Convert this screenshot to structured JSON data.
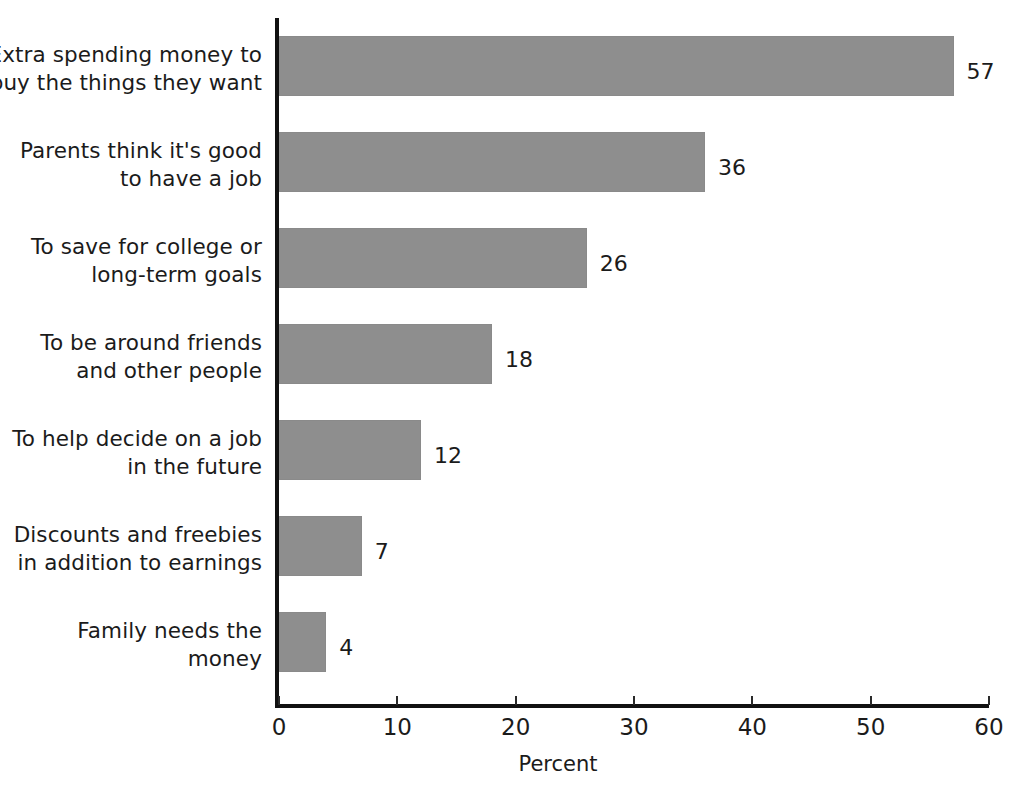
{
  "chart_data": {
    "type": "bar",
    "orientation": "horizontal",
    "title": "",
    "xlabel": "Percent",
    "ylabel": "",
    "xlim": [
      0,
      60
    ],
    "xticks": [
      0,
      10,
      20,
      30,
      40,
      50,
      60
    ],
    "xtick_labels": [
      "0",
      "10",
      "20",
      "30",
      "40",
      "50",
      "60"
    ],
    "grid": false,
    "legend": null,
    "bar_color": "#8e8e8e",
    "axis_color": "#111111",
    "text_color": "#1b1b1b",
    "categories": [
      "Extra spending money to\nbuy the things they want",
      "Parents think it's good\nto have a job",
      "To save for college or\nlong-term goals",
      "To be around friends\nand other people",
      "To help decide on a job\nin the future",
      "Discounts and freebies\nin addition to earnings",
      "Family needs the\nmoney"
    ],
    "values": [
      57,
      36,
      26,
      18,
      12,
      7,
      4
    ],
    "value_labels": [
      "57",
      "36",
      "26",
      "18",
      "12",
      "7",
      "4"
    ]
  }
}
